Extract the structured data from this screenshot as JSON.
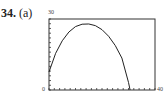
{
  "problem": {
    "number": "34.",
    "part": "(a)"
  },
  "chart_data": {
    "type": "line",
    "title": "",
    "xlabel": "",
    "ylabel": "",
    "xlim": [
      0,
      40
    ],
    "ylim": [
      0,
      30
    ],
    "x_tick_labels": [
      "0",
      "40"
    ],
    "y_tick_labels": [
      "30"
    ],
    "grid": false,
    "x": [
      0,
      2.5,
      5,
      7.5,
      10,
      12.5,
      15,
      17.5,
      20,
      22.5,
      25,
      27.5,
      30,
      30.6
    ],
    "series": [
      {
        "name": "curve",
        "values": [
          7.6,
          15.5,
          20.8,
          24.5,
          26.8,
          27.8,
          27.9,
          27.2,
          25.5,
          22.7,
          18.8,
          13.5,
          3.2,
          0
        ]
      }
    ]
  }
}
